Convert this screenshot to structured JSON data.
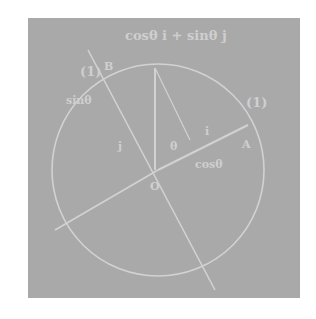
{
  "diagram": {
    "title": "cosθ i + sinθ j",
    "labels": {
      "origin": "O",
      "point_b": "B",
      "unit_b": "(1)",
      "unit_a": "(1)",
      "point_a": "A",
      "sin_label": "sinθ",
      "cos_label": "cosθ",
      "vec_i": "i",
      "vec_j": "j",
      "theta": "θ",
      "i_arrow": "i"
    },
    "colors": {
      "background": "#a9a9a9",
      "line": "#d2d2d2",
      "text": "#cfcfcf"
    }
  }
}
